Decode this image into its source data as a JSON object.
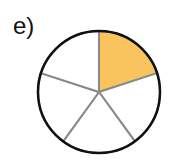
{
  "label": "e)",
  "diagram": {
    "type": "fraction-circle",
    "sectors": 5,
    "shaded_sectors": 1,
    "shaded_index": 0,
    "shade_color": "#F9C45E",
    "outline_color": "#111111",
    "divider_color": "#8a8a8a",
    "center": [
      99,
      92
    ],
    "radius": 61
  }
}
